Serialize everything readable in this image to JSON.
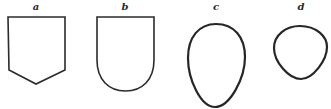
{
  "figure": {
    "shapes": [
      {
        "id": "a",
        "label": "a",
        "description": "shield with pointed base (pentagon)"
      },
      {
        "id": "b",
        "label": "b",
        "description": "shield with rounded base"
      },
      {
        "id": "c",
        "label": "c",
        "description": "egg / ovoid shape, narrow end down"
      },
      {
        "id": "d",
        "label": "d",
        "description": "small rounded triangular ovoid"
      }
    ],
    "colors": {
      "stroke": "#2b2b2b",
      "background": "#ffffff"
    }
  }
}
